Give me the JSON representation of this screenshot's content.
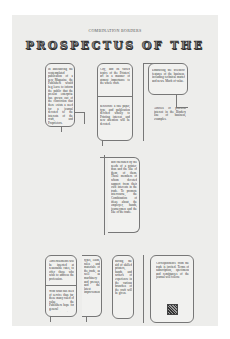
{
  "document": {
    "running_head": "COMBINATION BORDERS",
    "title": "PROSPECTUS OF THE",
    "colors": {
      "page": "#ededeb",
      "ink": "#333333",
      "rule": "#777777"
    }
  },
  "columns": {
    "top_left": "In announcing the contemplated publication of a new Magazine, the Publishers would beg leave to inform the public that the present enterprise has grown out of the conviction that there exists a need for a journal devoted to the interests of the craft, and Proprietors.",
    "top_mid_upper": "City, and its varied topics of the Printers' art in a manner of utmost importance to the whole craft.",
    "top_mid_lower": "heretofore a fine paper, type, and publication devoted wholly to Printing interest, and new attention will be devoted.",
    "top_right_upper": "Embracing the scientific features of the business, including technical matter and news. Much of value.",
    "top_right_lower": "Articles of practical interest in the Bindery line of business, examples.",
    "middle": "and cherished by the needs of a printer, thus and the like of them, of them. Those members of whom devoted support from their own interests in the trade. To promote intercourse, the Combination of ideas about the employer, hands, journeymen and the like of the trade.",
    "bottom_left_upper": "Advertisements will be inserted at reasonable rates, to offer those who wish to address the profession.",
    "bottom_left_lower": "With what has been of service thus far, these many ruled of value, the Publishers hope for general encouragement.",
    "bottom_mid_a": "types, leads, rules and materials of the trade, as well as machinery and presses, and the latest improvements.",
    "bottom_mid_b": "having the aid of skilled printers, hands, and writers of experience in the various branches of the craft will be given.",
    "bottom_right": "Correspondence from the trade is invited. Terms of subscription, specimens and remittances of the journal will follow."
  }
}
